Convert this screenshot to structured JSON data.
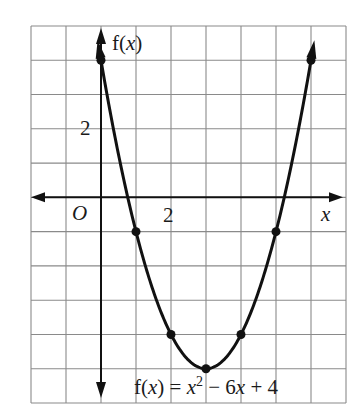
{
  "chart_data": {
    "type": "line",
    "title": "",
    "function_label": "f(x) = x² − 6x + 4",
    "equation": {
      "prefix": "f(",
      "var": "x",
      "mid": ") = ",
      "x2": "x",
      "sup": "2",
      "rest1": " − 6",
      "x1": "x",
      "rest2": " + 4"
    },
    "xlabel": "x",
    "ylabel": "f(x)",
    "origin_label": "O",
    "tick_labels": {
      "x": [
        {
          "value": 2,
          "label": "2"
        }
      ],
      "y": [
        {
          "value": 2,
          "label": "2"
        }
      ]
    },
    "xlim": [
      -2,
      7
    ],
    "ylim": [
      -6,
      5
    ],
    "grid": true,
    "series": [
      {
        "name": "f(x) = x^2 - 6x + 4",
        "curve": "parabola",
        "coefficients": {
          "a": 1,
          "b": -6,
          "c": 4
        },
        "domain": [
          -0.05,
          7.05
        ],
        "points": [
          {
            "x": 0,
            "y": 4
          },
          {
            "x": 1,
            "y": -1
          },
          {
            "x": 2,
            "y": -4
          },
          {
            "x": 3,
            "y": -5
          },
          {
            "x": 4,
            "y": -4
          },
          {
            "x": 5,
            "y": -1
          },
          {
            "x": 6,
            "y": 4
          }
        ]
      }
    ]
  },
  "layout": {
    "grid_left": 31,
    "grid_top": 26,
    "grid_right": 346,
    "grid_bottom": 403,
    "cols": 9,
    "rows": 11,
    "origin_col": 2,
    "origin_row": 5
  }
}
